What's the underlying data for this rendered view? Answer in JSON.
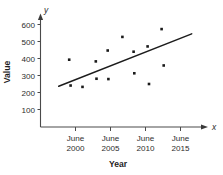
{
  "chart_data": {
    "type": "scatter",
    "title": "",
    "xlabel": "Year",
    "ylabel": "Value",
    "x_axis_name": "x",
    "y_axis_name": "y",
    "grid": false,
    "legend": "none",
    "xlim": [
      1997.5,
      2017.5
    ],
    "ylim": [
      0,
      630
    ],
    "y_ticks": [
      100,
      200,
      300,
      400,
      500,
      600
    ],
    "y_tick_labels": [
      "100",
      "200",
      "300",
      "400",
      "500",
      "600"
    ],
    "x_ticks": [
      2000,
      2005,
      2010,
      2015
    ],
    "x_tick_labels": [
      {
        "line1": "June",
        "line2": "2000"
      },
      {
        "line1": "June",
        "line2": "2005"
      },
      {
        "line1": "June",
        "line2": "2010"
      },
      {
        "line1": "June",
        "line2": "2015"
      }
    ],
    "points": [
      {
        "x": 1999.1,
        "y": 393
      },
      {
        "x": 1999.3,
        "y": 241
      },
      {
        "x": 2001.0,
        "y": 233
      },
      {
        "x": 2002.9,
        "y": 383
      },
      {
        "x": 2003.0,
        "y": 281
      },
      {
        "x": 2004.6,
        "y": 447
      },
      {
        "x": 2004.7,
        "y": 279
      },
      {
        "x": 2006.7,
        "y": 527
      },
      {
        "x": 2008.3,
        "y": 440
      },
      {
        "x": 2008.4,
        "y": 313
      },
      {
        "x": 2010.3,
        "y": 471
      },
      {
        "x": 2010.5,
        "y": 250
      },
      {
        "x": 2012.3,
        "y": 573
      },
      {
        "x": 2012.6,
        "y": 359
      }
    ],
    "trend_line": {
      "x_start": 1997.6,
      "y_start": 237,
      "x_end": 2016.6,
      "y_end": 545
    },
    "point_marker": "square",
    "point_color": "#1a1a1a",
    "line_color": "#1c1c1c",
    "axis_color": "#4a4a4a"
  }
}
